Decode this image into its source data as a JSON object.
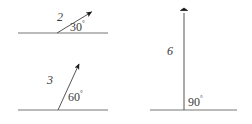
{
  "figure": {
    "type": "vector-diagram",
    "background_color": "#ffffff",
    "stroke_color": "#555555",
    "text_color": "#3a3a3a",
    "degree_symbol": "°",
    "panels": [
      {
        "id": "panel-a",
        "name": "vector-30-degrees",
        "magnitude": "2",
        "angle": "30",
        "baseline": {
          "x1": 18,
          "y1": 33,
          "x2": 108,
          "y2": 33
        },
        "vector": {
          "x1": 57,
          "y1": 33,
          "x2": 93,
          "y2": 11
        }
      },
      {
        "id": "panel-b",
        "name": "vector-60-degrees",
        "magnitude": "3",
        "angle": "60",
        "baseline": {
          "x1": 18,
          "y1": 110,
          "x2": 108,
          "y2": 110
        },
        "vector": {
          "x1": 58,
          "y1": 110,
          "x2": 80,
          "y2": 62
        }
      },
      {
        "id": "panel-c",
        "name": "vector-90-degrees",
        "magnitude": "6",
        "angle": "90",
        "baseline": {
          "x1": 150,
          "y1": 110,
          "x2": 237,
          "y2": 110
        },
        "vector": {
          "x1": 184,
          "y1": 110,
          "x2": 184,
          "y2": 10
        }
      }
    ]
  }
}
